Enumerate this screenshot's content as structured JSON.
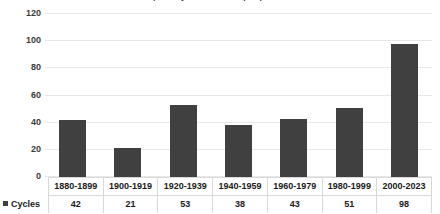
{
  "chart_data": {
    "type": "bar",
    "title": "Tropical cyclone counts per period",
    "xlabel": "",
    "ylabel": "",
    "ylim": [
      0,
      120
    ],
    "yticks": [
      0,
      20,
      40,
      60,
      80,
      100,
      120
    ],
    "grid": true,
    "legend_position": "bottom-left",
    "data_table": true,
    "bar_color": "#404040",
    "gridline_color": "#E8E8E8",
    "categories": [
      "1880-1899",
      "1900-1919",
      "1920-1939",
      "1940-1959",
      "1960-1979",
      "1980-1999",
      "2000-2023"
    ],
    "series": [
      {
        "name": "Cycles",
        "values": [
          42,
          21,
          53,
          38,
          43,
          51,
          98
        ]
      }
    ]
  },
  "axis": {
    "y_tick_labels": [
      "120",
      "100",
      "80",
      "60",
      "40",
      "20",
      "0"
    ]
  },
  "legend": {
    "series_label": "Cycles",
    "marker_icon": "square-marker-icon"
  },
  "table": {
    "category_row": [
      "1880-1899",
      "1900-1919",
      "1920-1939",
      "1940-1959",
      "1960-1979",
      "1980-1999",
      "2000-2023"
    ],
    "value_row": [
      "42",
      "21",
      "53",
      "38",
      "43",
      "51",
      "98"
    ]
  }
}
